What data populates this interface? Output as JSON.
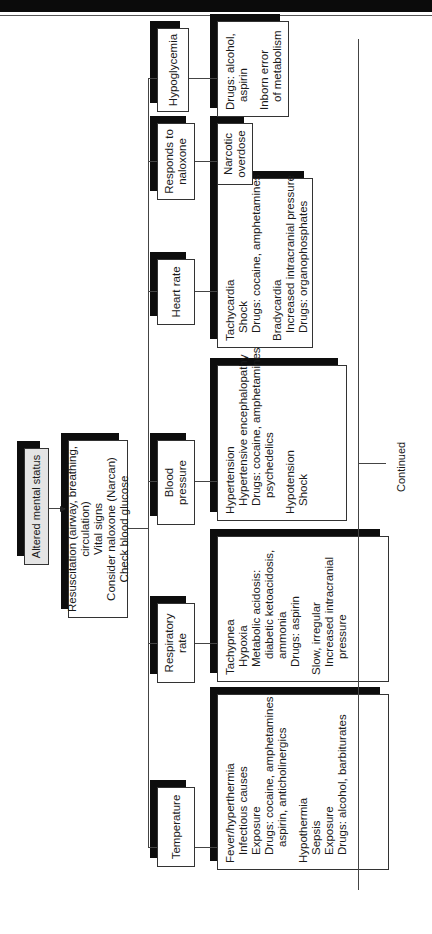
{
  "root": {
    "label": "Altered mental status"
  },
  "initial": {
    "lines": [
      "Resuscitation (airway, breathing, circulation)",
      "Vital signs",
      "Consider naloxone (Narcan)",
      "Check blood glucose"
    ]
  },
  "branches": [
    {
      "label": "Temperature",
      "details": [
        {
          "text": "Fever/hyperthermia",
          "indent": 0
        },
        {
          "text": "Infectious causes",
          "indent": 1
        },
        {
          "text": "Exposure",
          "indent": 1
        },
        {
          "text": "Drugs: cocaine, amphetamines",
          "indent": 1
        },
        {
          "text": "aspirin, anticholinergics",
          "indent": 2
        },
        {
          "text": "",
          "indent": -1
        },
        {
          "text": "Hypothermia",
          "indent": 0
        },
        {
          "text": "Sepsis",
          "indent": 1
        },
        {
          "text": "Exposure",
          "indent": 1
        },
        {
          "text": "Drugs: alcohol, barbiturates",
          "indent": 1
        }
      ]
    },
    {
      "label": "Respiratory rate",
      "details": [
        {
          "text": "Tachypnea",
          "indent": 0
        },
        {
          "text": "Hypoxia",
          "indent": 1
        },
        {
          "text": "Metabolic acidosis:",
          "indent": 1
        },
        {
          "text": "diabetic ketoacidosis,",
          "indent": 2
        },
        {
          "text": "ammonia",
          "indent": 2
        },
        {
          "text": "Drugs: aspirin",
          "indent": 1
        },
        {
          "text": "",
          "indent": -1
        },
        {
          "text": "Slow, irregular",
          "indent": 0
        },
        {
          "text": "Increased intracranial",
          "indent": 1
        },
        {
          "text": "pressure",
          "indent": 2
        }
      ]
    },
    {
      "label": "Blood pressure",
      "details": [
        {
          "text": "Hypertension",
          "indent": 0
        },
        {
          "text": "Hypertensive encephalopathy",
          "indent": 1
        },
        {
          "text": "Drugs: cocaine, amphetamines,",
          "indent": 1
        },
        {
          "text": "psychedelics",
          "indent": 2
        },
        {
          "text": "",
          "indent": -1
        },
        {
          "text": "Hypotension",
          "indent": 0
        },
        {
          "text": "Shock",
          "indent": 1
        }
      ]
    },
    {
      "label": "Heart rate",
      "details": [
        {
          "text": "Tachycardia",
          "indent": 0
        },
        {
          "text": "Shock",
          "indent": 1
        },
        {
          "text": "Drugs: cocaine, amphetamines",
          "indent": 1
        },
        {
          "text": "",
          "indent": -1
        },
        {
          "text": "Bradycardia",
          "indent": 0
        },
        {
          "text": "Increased intracranial pressure",
          "indent": 1
        },
        {
          "text": "Drugs: organophosphates",
          "indent": 1
        }
      ]
    },
    {
      "label": "Responds to naloxone",
      "label_lines": [
        "Responds to",
        "naloxone"
      ],
      "details": [
        {
          "text": "Narcotic",
          "indent": 0
        },
        {
          "text": "overdose",
          "indent": 0
        }
      ]
    },
    {
      "label": "Hypoglycemia",
      "details": [
        {
          "text": "Drugs: alcohol,",
          "indent": 0
        },
        {
          "text": "aspirin",
          "indent": 1
        },
        {
          "text": "",
          "indent": -1
        },
        {
          "text": "Inborn error",
          "indent": 0
        },
        {
          "text": "of metabolism",
          "indent": 1
        }
      ]
    }
  ],
  "footer": {
    "continued": "Continued"
  },
  "colors": {
    "shadow": "#0d0d0d",
    "root_fill": "#e4e4e4",
    "line": "#444444"
  }
}
